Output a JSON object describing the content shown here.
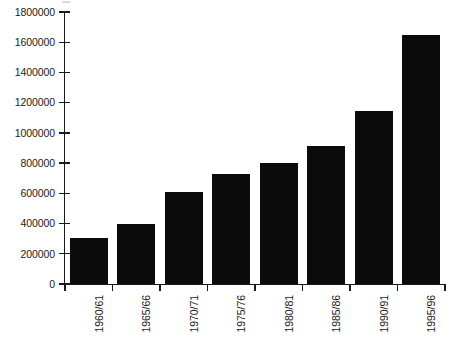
{
  "chart_data": {
    "type": "bar",
    "title": "",
    "subtitle": "",
    "xlabel": "",
    "ylabel": "",
    "categories": [
      "1960/61",
      "1965/66",
      "1970/71",
      "1975/76",
      "1980/81",
      "1985/86",
      "1990/91",
      "1995/96"
    ],
    "values": [
      305000,
      400000,
      610000,
      725000,
      800000,
      910000,
      1145000,
      1650000
    ],
    "series": [
      {
        "name": "",
        "values": [
          305000,
          400000,
          610000,
          725000,
          800000,
          910000,
          1145000,
          1650000
        ]
      }
    ],
    "ylim": [
      0,
      1800000
    ],
    "ytick_values": [
      0,
      200000,
      400000,
      600000,
      800000,
      1000000,
      1200000,
      1400000,
      1600000,
      1800000
    ],
    "ytick_labels": [
      "0",
      "200000",
      "400000",
      "600000",
      "800000",
      "1000000",
      "1200000",
      "1400000",
      "1600000",
      "1800000"
    ],
    "grid": false,
    "legend": [],
    "legend_position": "none",
    "bar_color": "#0b0b0b",
    "axis_color": "#1a1a1a",
    "background_color": "#ffffff",
    "xtick_label_rotation": 90,
    "annotations": []
  }
}
